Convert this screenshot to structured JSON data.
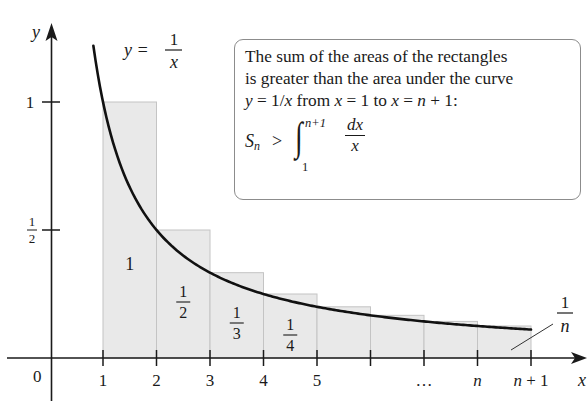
{
  "chart_data": {
    "type": "bar",
    "curve": {
      "label_lhs": "y =",
      "label_num": "1",
      "label_den": "x",
      "function": "y = 1/x",
      "x_start": 0.82,
      "x_end": 9
    },
    "x_axis": {
      "label": "x",
      "origin_label": "0",
      "ticks": [
        {
          "pos": 1,
          "label": "1"
        },
        {
          "pos": 2,
          "label": "2"
        },
        {
          "pos": 3,
          "label": "3"
        },
        {
          "pos": 4,
          "label": "4"
        },
        {
          "pos": 5,
          "label": "5"
        },
        {
          "pos": 6,
          "label": ""
        },
        {
          "pos": 7,
          "label": "…"
        },
        {
          "pos": 8,
          "label": "n"
        },
        {
          "pos": 9,
          "label": "n + 1"
        }
      ]
    },
    "y_axis": {
      "label": "y",
      "ticks": [
        {
          "pos": 1,
          "label": "1"
        },
        {
          "pos": 0.5,
          "label_num": "1",
          "label_den": "2"
        }
      ]
    },
    "rectangles": [
      {
        "x0": 1,
        "x1": 2,
        "height": 1,
        "label": "1"
      },
      {
        "x0": 2,
        "x1": 3,
        "height": 0.5,
        "label_num": "1",
        "label_den": "2"
      },
      {
        "x0": 3,
        "x1": 4,
        "height": 0.3333,
        "label_num": "1",
        "label_den": "3"
      },
      {
        "x0": 4,
        "x1": 5,
        "height": 0.25,
        "label_num": "1",
        "label_den": "4"
      },
      {
        "x0": 5,
        "x1": 6,
        "height": 0.2
      },
      {
        "x0": 6,
        "x1": 7,
        "height": 0.1667
      },
      {
        "x0": 7,
        "x1": 8,
        "height": 0.1429
      },
      {
        "x0": 8,
        "x1": 9,
        "height": 0.125,
        "leader_label_num": "1",
        "leader_label_den": "n"
      }
    ],
    "colors": {
      "rect_fill": "#e9e9e9",
      "rect_stroke": "#c4c4c4",
      "curve": "#111111",
      "axis": "#1a1a1a",
      "callout_border": "#8c8c8c"
    }
  },
  "callout": {
    "line1": "The sum of the areas of the rectangles",
    "line2": "is greater than the area under the curve",
    "line3_a": "y",
    "line3_b": " = 1/",
    "line3_c": "x",
    "line3_d": " from ",
    "line3_e": "x",
    "line3_f": " = 1 to ",
    "line3_g": "x",
    "line3_h": " = ",
    "line3_i": "n",
    "line3_j": " + 1:",
    "formula": {
      "s": "S",
      "s_sub": "n",
      "gt": ">",
      "integral": "∫",
      "upper": "n+1",
      "lower": "1",
      "num": "dx",
      "den": "x"
    }
  }
}
